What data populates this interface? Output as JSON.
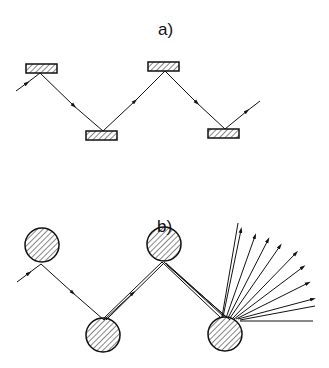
{
  "panels": [
    {
      "label": "a)",
      "description": "Ray reflecting between alternating flat plate reflectors (zigzag path)"
    },
    {
      "label": "b)",
      "description": "Ray reflecting between alternating cylindrical reflectors; beam diverges into a fan after successive reflections"
    }
  ],
  "colors": {
    "stroke": "#111111",
    "background": "#ffffff"
  }
}
